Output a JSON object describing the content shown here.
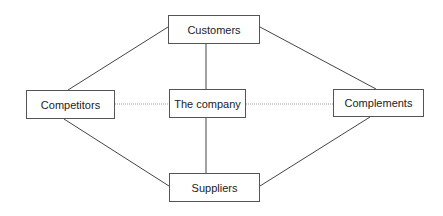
{
  "diagram": {
    "title": "",
    "nodes": [
      {
        "id": "customers",
        "label": "Customers"
      },
      {
        "id": "competitors",
        "label": "Competitors"
      },
      {
        "id": "company",
        "label": "The company"
      },
      {
        "id": "complements",
        "label": "Complements"
      },
      {
        "id": "suppliers",
        "label": "Suppliers"
      }
    ],
    "edges": [
      {
        "from": "customers",
        "to": "competitors",
        "style": "solid"
      },
      {
        "from": "customers",
        "to": "complements",
        "style": "solid"
      },
      {
        "from": "customers",
        "to": "company",
        "style": "solid"
      },
      {
        "from": "suppliers",
        "to": "competitors",
        "style": "solid"
      },
      {
        "from": "suppliers",
        "to": "complements",
        "style": "solid"
      },
      {
        "from": "suppliers",
        "to": "company",
        "style": "solid"
      },
      {
        "from": "competitors",
        "to": "company",
        "style": "dotted"
      },
      {
        "from": "company",
        "to": "complements",
        "style": "dotted"
      }
    ],
    "colors": {
      "line": "#444444",
      "dotted_line": "#999999",
      "box_border": "#555555"
    }
  }
}
